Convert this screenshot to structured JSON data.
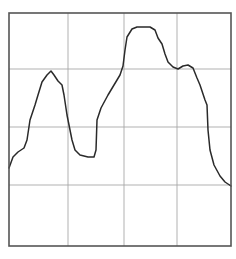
{
  "chart_data": {
    "type": "line",
    "title": "",
    "xlabel": "",
    "ylabel": "",
    "grid": true,
    "legend": null,
    "grid_divisions": {
      "x": 4,
      "y": 4
    },
    "xlim": [
      0,
      4
    ],
    "ylim": [
      0,
      4
    ],
    "series": [
      {
        "name": "trace",
        "color": "#2a2a2a",
        "x": [
          0.0,
          0.07,
          0.16,
          0.27,
          0.32,
          0.38,
          0.47,
          0.52,
          0.59,
          0.68,
          0.76,
          0.81,
          0.88,
          0.95,
          0.99,
          1.04,
          1.09,
          1.13,
          1.19,
          1.28,
          1.42,
          1.53,
          1.57,
          1.59,
          1.66,
          1.78,
          1.89,
          2.0,
          2.06,
          2.09,
          2.13,
          2.22,
          2.31,
          2.54,
          2.63,
          2.68,
          2.76,
          2.81,
          2.86,
          2.95,
          3.04,
          3.13,
          3.21,
          3.3,
          3.37,
          3.42,
          3.51,
          3.55,
          3.57,
          3.6,
          3.68,
          3.78,
          3.87,
          4.0
        ],
        "y": [
          1.34,
          1.53,
          1.62,
          1.69,
          1.82,
          2.17,
          2.43,
          2.6,
          2.83,
          2.95,
          3.02,
          2.95,
          2.85,
          2.78,
          2.61,
          2.26,
          2.0,
          1.82,
          1.65,
          1.56,
          1.53,
          1.53,
          1.65,
          2.17,
          2.38,
          2.61,
          2.78,
          2.95,
          3.11,
          3.39,
          3.61,
          3.75,
          3.79,
          3.79,
          3.74,
          3.6,
          3.5,
          3.33,
          3.19,
          3.1,
          3.06,
          3.12,
          3.13,
          3.08,
          2.91,
          2.79,
          2.53,
          2.44,
          2.0,
          1.65,
          1.39,
          1.2,
          1.1,
          1.03
        ]
      }
    ]
  },
  "plot": {
    "left": 9,
    "top": 13,
    "right": 231,
    "bottom": 246,
    "vgrid_x": [
      68,
      124,
      177
    ],
    "hgrid_y": [
      69,
      127,
      185
    ],
    "path": "M9,168 L13,157 L18,152 L24,148 L27,140 L30,120 L35,105 L38,95 L42,82 L47,75 L51,71 L54,75 L58,81 L62,85 L64,95 L67,115 L70,130 L72,140 L75,150 L80,155 L88,157 L94,157 L96,150 L97,120 L101,108 L108,95 L114,85 L120,75 L123,66 L125,50 L127,37 L132,29 L137,27 L150,27 L155,30 L158,38 L162,44 L165,54 L168,62 L173,67 L178,69 L183,66 L188,65 L193,68 L197,78 L200,85 L205,100 L207,105 L208,130 L210,150 L214,165 L220,176 L225,182 L231,186"
  }
}
